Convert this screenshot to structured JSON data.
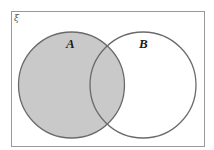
{
  "diagram": {
    "type": "venn",
    "universal_set": {
      "symbol": "ξ",
      "rect": {
        "x": 11.5,
        "y": 11.5,
        "width": 193,
        "height": 135
      },
      "stroke": "#999999"
    },
    "sets": [
      {
        "label": "A",
        "cx": 71.5,
        "cy": 85,
        "r": 53,
        "label_x": 66,
        "label_y": 48,
        "shaded": true
      },
      {
        "label": "B",
        "cx": 143,
        "cy": 85,
        "r": 53,
        "label_x": 139,
        "label_y": 48,
        "shaded": false
      }
    ],
    "shaded_region": "A",
    "colors": {
      "shade": "#c9c9c9",
      "circle_stroke": "#6a6a6a",
      "background": "#ffffff"
    }
  }
}
